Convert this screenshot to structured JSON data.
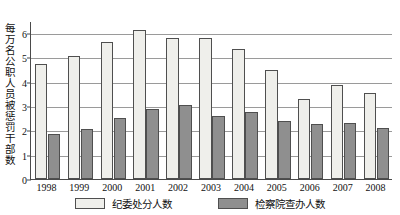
{
  "chart_data": {
    "type": "bar",
    "title": "",
    "xlabel": "",
    "ylabel": "每万名公职人员被惩罚干部数",
    "ylim": [
      0,
      6.5
    ],
    "yticks": [
      0,
      1,
      2,
      3,
      4,
      5,
      6
    ],
    "grid": true,
    "legend_position": "bottom",
    "categories": [
      "1998",
      "1999",
      "2000",
      "2001",
      "2002",
      "2003",
      "2004",
      "2005",
      "2006",
      "2007",
      "2008"
    ],
    "series": [
      {
        "name": "纪委处分人数",
        "color": "#efefeb",
        "values": [
          4.75,
          5.05,
          5.65,
          6.15,
          5.8,
          5.8,
          5.35,
          4.5,
          3.3,
          3.85,
          3.55
        ]
      },
      {
        "name": "检察院查办人数",
        "color": "#8f8f8f",
        "values": [
          1.85,
          2.05,
          2.5,
          2.9,
          3.05,
          2.6,
          2.75,
          2.4,
          2.25,
          2.3,
          2.1
        ]
      }
    ]
  }
}
